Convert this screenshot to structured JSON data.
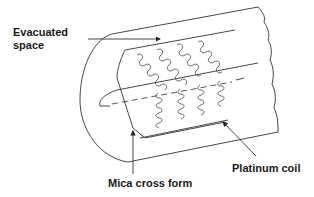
{
  "diagram": {
    "labels": {
      "evacuated_space": [
        "Evacuated",
        "space"
      ],
      "mica_cross_form": "Mica cross form",
      "platinum_coil": "Platinum coil"
    },
    "colors": {
      "background": "#ffffff",
      "line": "#333333",
      "text": "#1a1a1a"
    }
  }
}
